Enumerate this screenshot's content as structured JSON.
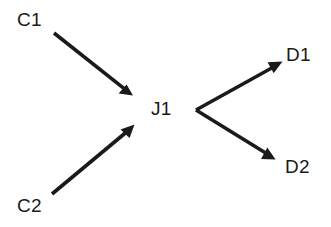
{
  "diagram": {
    "background_color": "#ffffff",
    "stroke_color": "#1a1a1a",
    "text_color": "#1a1a1a",
    "stroke_width": 3.6,
    "width": 331,
    "height": 227,
    "nodes": [
      {
        "id": "c1",
        "label": "C1",
        "x": 17,
        "y": 10,
        "role": "source"
      },
      {
        "id": "c2",
        "label": "C2",
        "x": 17,
        "y": 196,
        "role": "source"
      },
      {
        "id": "j1",
        "label": "J1",
        "x": 151,
        "y": 99,
        "role": "junction"
      },
      {
        "id": "d1",
        "label": "D1",
        "x": 286,
        "y": 45,
        "role": "destination"
      },
      {
        "id": "d2",
        "label": "D2",
        "x": 285,
        "y": 157,
        "role": "destination"
      }
    ],
    "edges": [
      {
        "id": "edge-c1-j1",
        "from": "C1",
        "to": "J1",
        "x1": 54,
        "y1": 33,
        "x2": 131,
        "y2": 94,
        "arrowhead": "end"
      },
      {
        "id": "edge-c2-j1",
        "from": "C2",
        "to": "J1",
        "x1": 52,
        "y1": 194,
        "x2": 133,
        "y2": 126,
        "arrowhead": "end"
      },
      {
        "id": "edge-j1-d1",
        "from": "J1",
        "to": "D1",
        "x1": 196,
        "y1": 110,
        "x2": 281,
        "y2": 62,
        "arrowhead": "end"
      },
      {
        "id": "edge-j1-d2",
        "from": "J1",
        "to": "D2",
        "x1": 196,
        "y1": 110,
        "x2": 274,
        "y2": 159,
        "arrowhead": "end"
      }
    ]
  }
}
